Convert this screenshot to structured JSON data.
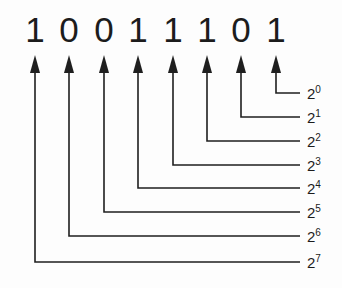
{
  "binary_number": "10011101",
  "bits": [
    {
      "digit": "1",
      "base": "2",
      "exponent": "7",
      "x": 35,
      "line_y": 262
    },
    {
      "digit": "0",
      "base": "2",
      "exponent": "6",
      "x": 69,
      "line_y": 236
    },
    {
      "digit": "0",
      "base": "2",
      "exponent": "5",
      "x": 104,
      "line_y": 212
    },
    {
      "digit": "1",
      "base": "2",
      "exponent": "4",
      "x": 138,
      "line_y": 188
    },
    {
      "digit": "1",
      "base": "2",
      "exponent": "3",
      "x": 173,
      "line_y": 165
    },
    {
      "digit": "1",
      "base": "2",
      "exponent": "2",
      "x": 207,
      "line_y": 141
    },
    {
      "digit": "0",
      "base": "2",
      "exponent": "1",
      "x": 241,
      "line_y": 117
    },
    {
      "digit": "1",
      "base": "2",
      "exponent": "0",
      "x": 276,
      "line_y": 93
    }
  ],
  "line_end_x": 300,
  "label_x": 307,
  "line_color": "#1f1f1f"
}
